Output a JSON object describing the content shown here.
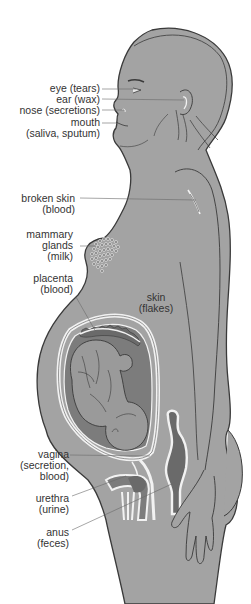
{
  "figure": {
    "colors": {
      "body_fill": "#a3a3a3",
      "body_outline": "#3a3a3a",
      "dark_fill": "#7c7c7c",
      "highlight": "#f2f2f2",
      "label_text": "#333333",
      "leader_line": "#6a6a6a",
      "background": "#ffffff"
    },
    "labels": {
      "eye": {
        "line1": "eye (tears)"
      },
      "ear": {
        "line1": "ear (wax)"
      },
      "nose": {
        "line1": "nose (secretions)"
      },
      "mouth": {
        "line1": "mouth",
        "line2": "(saliva, sputum)"
      },
      "broken_skin": {
        "line1": "broken skin",
        "line2": "(blood)"
      },
      "mammary": {
        "line1": "mammary",
        "line2": "glands",
        "line3": "(milk)"
      },
      "placenta": {
        "line1": "placenta",
        "line2": "(blood)"
      },
      "skin": {
        "line1": "skin",
        "line2": "(flakes)"
      },
      "vagina": {
        "line1": "vagina",
        "line2": "(secretion,",
        "line3": "blood)"
      },
      "urethra": {
        "line1": "urethra",
        "line2": "(urine)"
      },
      "anus": {
        "line1": "anus",
        "line2": "(feces)"
      }
    }
  }
}
